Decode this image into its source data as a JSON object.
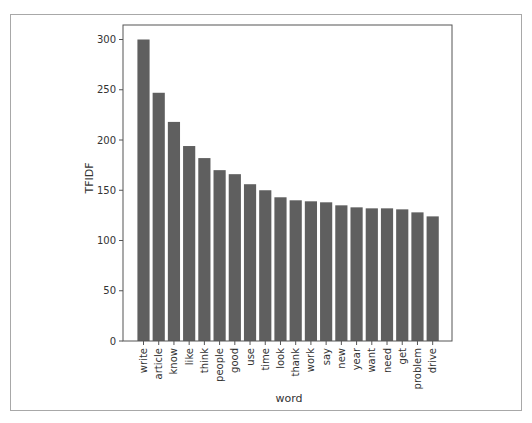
{
  "chart_data": {
    "type": "bar",
    "title": "",
    "xlabel": "word",
    "ylabel": "TFIDF",
    "categories": [
      "write",
      "article",
      "know",
      "like",
      "think",
      "people",
      "good",
      "use",
      "time",
      "look",
      "thank",
      "work",
      "say",
      "new",
      "year",
      "want",
      "need",
      "get",
      "problem",
      "drive"
    ],
    "values": [
      300,
      247,
      218,
      194,
      182,
      170,
      166,
      156,
      150,
      143,
      140,
      139,
      138,
      135,
      133,
      132,
      132,
      131,
      128,
      124
    ],
    "yticks": [
      0,
      50,
      100,
      150,
      200,
      250,
      300
    ],
    "ylim": [
      0,
      314
    ],
    "xtick_rotation": 90,
    "grid": false,
    "legend": null,
    "bar_color": "#5f5f5f",
    "axis_color": "#555555"
  }
}
